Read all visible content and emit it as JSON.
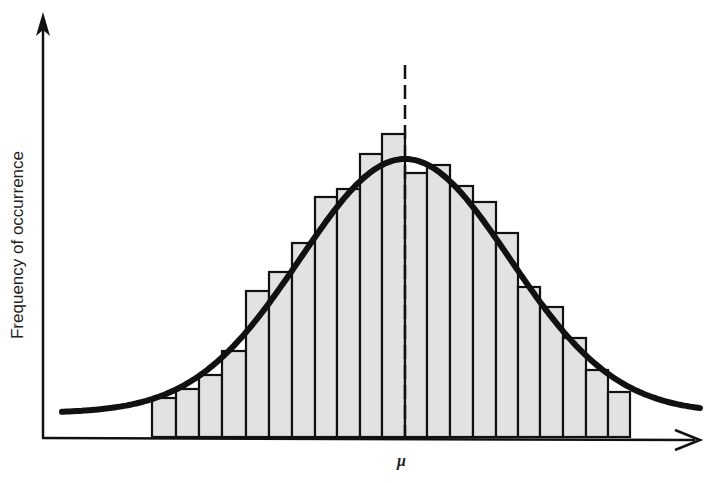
{
  "chart_data": {
    "type": "bar",
    "title": "",
    "xlabel": "",
    "ylabel": "Frequency of occurrence",
    "annotations": [
      {
        "text": "μ",
        "position": "x-axis at mean (dashed vertical line)"
      }
    ],
    "grid": false,
    "legend": null,
    "categories": [
      "1",
      "2",
      "3",
      "4",
      "5",
      "6",
      "7",
      "8",
      "9",
      "10",
      "11",
      "12",
      "13",
      "14",
      "15",
      "16",
      "17",
      "18",
      "19",
      "20",
      "21"
    ],
    "values": [
      39,
      48,
      62,
      86,
      146,
      165,
      194,
      240,
      248,
      283,
      303,
      264,
      272,
      251,
      235,
      204,
      150,
      130,
      99,
      67,
      45
    ],
    "overlay": {
      "type": "line",
      "name": "Normal distribution curve",
      "mean_category_index": 11,
      "peak_relative_height": 278
    },
    "units": "relative frequency (pixels above baseline)",
    "ylim": [
      0,
      400
    ]
  },
  "labels": {
    "ylabel": "Frequency of occurrence",
    "mean": "μ"
  },
  "style": {
    "bar_fill": "#e2e2e2",
    "bar_stroke": "#111111",
    "curve_color": "#111111",
    "axis_color": "#111111"
  },
  "geometry": {
    "bar_edges": [
      152,
      176,
      199,
      222,
      246,
      269,
      292,
      315,
      337,
      360,
      382,
      405,
      427,
      450,
      473,
      496,
      518,
      540,
      563,
      586,
      608,
      630
    ],
    "baseline": 437,
    "mean_x": 405
  }
}
